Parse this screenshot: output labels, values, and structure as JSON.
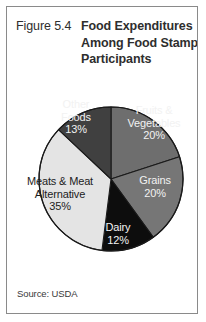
{
  "figure": {
    "number_label": "Figure 5.4",
    "title_lines": [
      "Food Expenditures",
      "Among Food Stamp",
      "Participants"
    ],
    "source": "Source: USDA"
  },
  "chart_data": {
    "type": "pie",
    "title": "Food Expenditures Among Food Stamp Participants",
    "xlabel": "",
    "ylabel": "",
    "units": "percent",
    "start_angle_deg": 0,
    "direction": "clockwise",
    "legend": "none (labels on slices)",
    "grid": false,
    "categories": [
      "Fruits & Vegetables",
      "Grains",
      "Dairy",
      "Meats & Meat Alternative",
      "Other Foods"
    ],
    "values": [
      20,
      20,
      12,
      35,
      13
    ],
    "total": 100,
    "slices": [
      {
        "name": "Fruits & Vegetables",
        "name_lines": [
          "Fruits &",
          "Vegetables"
        ],
        "value": 20,
        "pct_label": "20%",
        "color": "#6e6e6e",
        "label_color": "#f2f2f2"
      },
      {
        "name": "Grains",
        "name_lines": [
          "Grains"
        ],
        "value": 20,
        "pct_label": "20%",
        "color": "#767676",
        "label_color": "#f2f2f2"
      },
      {
        "name": "Dairy",
        "name_lines": [
          "Dairy"
        ],
        "value": 12,
        "pct_label": "12%",
        "color": "#0d0d0d",
        "label_color": "#f2f2f2"
      },
      {
        "name": "Meats & Meat Alternative",
        "name_lines": [
          "Meats & Meat",
          "Alternative"
        ],
        "value": 35,
        "pct_label": "35%",
        "color": "#e4e4e4",
        "label_color": "#1c1c1c"
      },
      {
        "name": "Other Foods",
        "name_lines": [
          "Other",
          "Foods"
        ],
        "value": 13,
        "pct_label": "13%",
        "color": "#404040",
        "label_color": "#f2f2f2"
      }
    ],
    "colors": {
      "outline": "#1a1a1a",
      "frame": "#8a8a8a",
      "background": "#ffffff",
      "text": "#2e2e2e"
    }
  }
}
